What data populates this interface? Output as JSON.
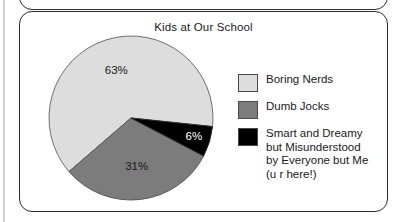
{
  "page": {
    "background_color": "#ffffff",
    "panel_border_color": "#2b2b2b"
  },
  "chart_data": {
    "type": "pie",
    "title": "Kids at Our School",
    "categories": [
      "Boring Nerds",
      "Dumb Jocks",
      "Smart and Dreamy but Misunderstood by Everyone but Me (u r here!)"
    ],
    "values": [
      63,
      31,
      6
    ],
    "value_labels": [
      "63%",
      "31%",
      "6%"
    ],
    "colors": [
      "#dddddd",
      "#7c7c7c",
      "#000000"
    ],
    "units": "percent",
    "legend_position": "right",
    "grid": false,
    "slices": [
      {
        "label": "Boring Nerds",
        "value": 63,
        "value_label": "63%",
        "color": "#dddddd",
        "label_text_color": "#1a1a1a"
      },
      {
        "label": "Dumb Jocks",
        "value": 31,
        "value_label": "31%",
        "color": "#7c7c7c",
        "label_text_color": "#1a1a1a"
      },
      {
        "label": "Smart and Dreamy\nbut Misunderstood\nby Everyone but Me\n(u r here!)",
        "value": 6,
        "value_label": "6%",
        "color": "#000000",
        "label_text_color": "#ffffff"
      }
    ]
  },
  "legend": {
    "items": [
      {
        "label": "Boring Nerds",
        "color": "#dddddd"
      },
      {
        "label": "Dumb Jocks",
        "color": "#7c7c7c"
      },
      {
        "label": "Smart and Dreamy\nbut Misunderstood\nby Everyone but Me\n(u r here!)",
        "color": "#000000"
      }
    ]
  }
}
